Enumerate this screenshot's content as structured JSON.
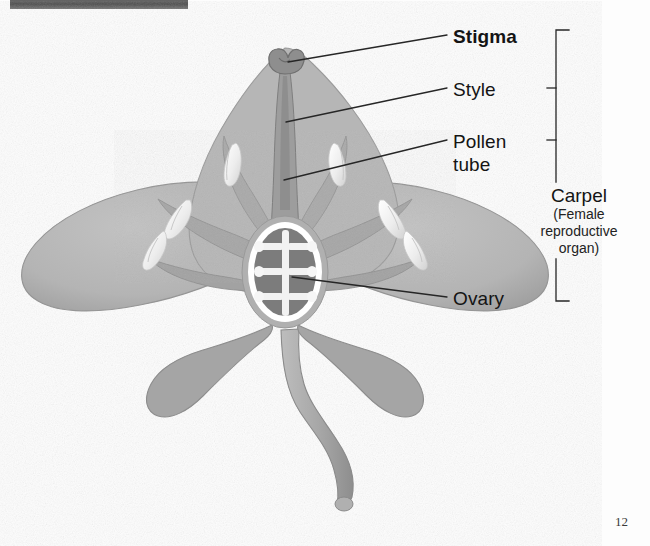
{
  "figure": {
    "page_number": "12",
    "scan_artifact": "dark-bar-top-left"
  },
  "labels": {
    "stigma": "Stigma",
    "style": "Style",
    "pollen_tube_line1": "Pollen",
    "pollen_tube_line2": "tube",
    "ovary": "Ovary",
    "carpel": "Carpel",
    "carpel_sub_line1": "(Female",
    "carpel_sub_line2": "reproductive",
    "carpel_sub_line3": "organ)"
  },
  "colors": {
    "petal_light": "#b9b9b9",
    "petal_mid": "#ababab",
    "petal_dark": "#9a9a9a",
    "sepal": "#a3a3a3",
    "stem": "#a8a8a8",
    "ovary_fill": "#7c7c7c",
    "ovary_outline": "#ffffff",
    "anther_white": "#f4f4f4",
    "leader_line": "#2b2b2b",
    "text": "#141414",
    "background": "#fdfdfd"
  },
  "parts": {
    "anther_count": 6,
    "ovule_pairs": 3,
    "lateral_petals": 2,
    "lower_sepals": 2,
    "top_petal": 1
  }
}
